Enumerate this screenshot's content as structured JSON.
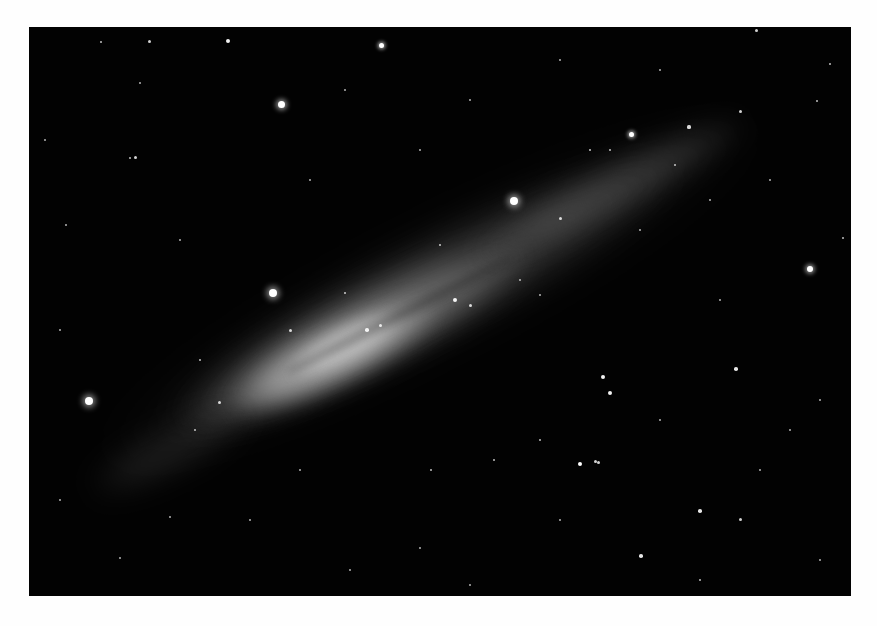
{
  "image": {
    "subject": "edge-on spiral galaxy against star field",
    "border_color": "#fefefe",
    "sky_color": "#020202",
    "frame": {
      "left": 29,
      "top": 27,
      "right": 851,
      "bottom": 596
    }
  },
  "galaxy": {
    "center": [
      390,
      305
    ],
    "angle_deg": -27,
    "layers": [
      {
        "w": 720,
        "h": 120,
        "color": "rgba(120,120,120,0.10)",
        "blur": 18,
        "cx": 430,
        "cy": 290
      },
      {
        "w": 560,
        "h": 95,
        "color": "rgba(150,150,150,0.22)",
        "blur": 14,
        "cx": 420,
        "cy": 295
      },
      {
        "w": 380,
        "h": 80,
        "color": "rgba(180,180,180,0.40)",
        "blur": 12,
        "cx": 360,
        "cy": 335
      },
      {
        "w": 230,
        "h": 60,
        "color": "rgba(205,205,205,0.55)",
        "blur": 10,
        "cx": 335,
        "cy": 355
      },
      {
        "w": 120,
        "h": 34,
        "color": "rgba(225,225,225,0.55)",
        "blur": 8,
        "cx": 345,
        "cy": 345
      },
      {
        "w": 300,
        "h": 50,
        "color": "rgba(150,150,150,0.25)",
        "blur": 12,
        "cx": 610,
        "cy": 190
      },
      {
        "w": 180,
        "h": 45,
        "color": "rgba(120,120,120,0.20)",
        "blur": 14,
        "cx": 170,
        "cy": 450
      }
    ],
    "dust_lane": {
      "w": 260,
      "h": 10,
      "color": "rgba(20,20,20,0.35)",
      "cx": 400,
      "cy": 315
    }
  },
  "stars": [
    {
      "x": 281,
      "y": 104,
      "r": 3.5
    },
    {
      "x": 381,
      "y": 45,
      "r": 2.5
    },
    {
      "x": 273,
      "y": 293,
      "r": 4
    },
    {
      "x": 89,
      "y": 401,
      "r": 4
    },
    {
      "x": 514,
      "y": 201,
      "r": 4
    },
    {
      "x": 810,
      "y": 269,
      "r": 3
    },
    {
      "x": 631,
      "y": 134,
      "r": 2.5
    },
    {
      "x": 149,
      "y": 41,
      "r": 1.5
    },
    {
      "x": 101,
      "y": 42,
      "r": 1.2
    },
    {
      "x": 135,
      "y": 157,
      "r": 1.5
    },
    {
      "x": 130,
      "y": 158,
      "r": 1.2
    },
    {
      "x": 228,
      "y": 41,
      "r": 2
    },
    {
      "x": 140,
      "y": 83,
      "r": 1
    },
    {
      "x": 603,
      "y": 377,
      "r": 2
    },
    {
      "x": 610,
      "y": 393,
      "r": 2
    },
    {
      "x": 580,
      "y": 464,
      "r": 2.2
    },
    {
      "x": 595,
      "y": 461,
      "r": 1.5
    },
    {
      "x": 598,
      "y": 462,
      "r": 1.5
    },
    {
      "x": 736,
      "y": 369,
      "r": 1.8
    },
    {
      "x": 700,
      "y": 511,
      "r": 1.8
    },
    {
      "x": 740,
      "y": 519,
      "r": 1.5
    },
    {
      "x": 641,
      "y": 556,
      "r": 1.8
    },
    {
      "x": 689,
      "y": 127,
      "r": 1.6
    },
    {
      "x": 756,
      "y": 30,
      "r": 1.5
    },
    {
      "x": 740,
      "y": 111,
      "r": 1.5
    },
    {
      "x": 830,
      "y": 64,
      "r": 1.2
    },
    {
      "x": 817,
      "y": 101,
      "r": 1.2
    },
    {
      "x": 843,
      "y": 238,
      "r": 1.2
    },
    {
      "x": 494,
      "y": 460,
      "r": 1.2
    },
    {
      "x": 431,
      "y": 470,
      "r": 1.2
    },
    {
      "x": 540,
      "y": 440,
      "r": 1.2
    },
    {
      "x": 420,
      "y": 548,
      "r": 1
    },
    {
      "x": 170,
      "y": 517,
      "r": 1
    },
    {
      "x": 60,
      "y": 500,
      "r": 1
    },
    {
      "x": 120,
      "y": 558,
      "r": 1
    },
    {
      "x": 470,
      "y": 585,
      "r": 1
    },
    {
      "x": 350,
      "y": 570,
      "r": 1
    },
    {
      "x": 700,
      "y": 580,
      "r": 1.2
    },
    {
      "x": 790,
      "y": 430,
      "r": 1
    },
    {
      "x": 820,
      "y": 400,
      "r": 1
    },
    {
      "x": 66,
      "y": 225,
      "r": 1
    },
    {
      "x": 180,
      "y": 240,
      "r": 1
    },
    {
      "x": 60,
      "y": 330,
      "r": 1
    },
    {
      "x": 200,
      "y": 360,
      "r": 1.2
    },
    {
      "x": 310,
      "y": 180,
      "r": 1
    },
    {
      "x": 420,
      "y": 150,
      "r": 1
    },
    {
      "x": 470,
      "y": 100,
      "r": 1
    },
    {
      "x": 560,
      "y": 60,
      "r": 1
    },
    {
      "x": 660,
      "y": 70,
      "r": 1
    },
    {
      "x": 770,
      "y": 180,
      "r": 1
    },
    {
      "x": 720,
      "y": 300,
      "r": 1
    },
    {
      "x": 660,
      "y": 420,
      "r": 1
    },
    {
      "x": 760,
      "y": 470,
      "r": 1
    },
    {
      "x": 300,
      "y": 470,
      "r": 1
    },
    {
      "x": 250,
      "y": 520,
      "r": 1
    },
    {
      "x": 560,
      "y": 520,
      "r": 1
    },
    {
      "x": 820,
      "y": 560,
      "r": 1
    },
    {
      "x": 45,
      "y": 140,
      "r": 1
    },
    {
      "x": 345,
      "y": 90,
      "r": 1
    },
    {
      "x": 440,
      "y": 245,
      "r": 1.3
    },
    {
      "x": 560,
      "y": 218,
      "r": 1.5
    },
    {
      "x": 470,
      "y": 305,
      "r": 1.5
    },
    {
      "x": 345,
      "y": 293,
      "r": 1.3
    },
    {
      "x": 290,
      "y": 330,
      "r": 1.5
    },
    {
      "x": 219,
      "y": 402,
      "r": 1.5
    },
    {
      "x": 195,
      "y": 430,
      "r": 1.2
    },
    {
      "x": 367,
      "y": 330,
      "r": 1.8
    },
    {
      "x": 380,
      "y": 325,
      "r": 1.5
    },
    {
      "x": 455,
      "y": 300,
      "r": 2
    },
    {
      "x": 590,
      "y": 150,
      "r": 1.3
    },
    {
      "x": 610,
      "y": 150,
      "r": 1.2
    },
    {
      "x": 675,
      "y": 165,
      "r": 1.2
    },
    {
      "x": 520,
      "y": 280,
      "r": 1
    },
    {
      "x": 540,
      "y": 295,
      "r": 1
    },
    {
      "x": 640,
      "y": 230,
      "r": 1
    },
    {
      "x": 710,
      "y": 200,
      "r": 1
    }
  ]
}
